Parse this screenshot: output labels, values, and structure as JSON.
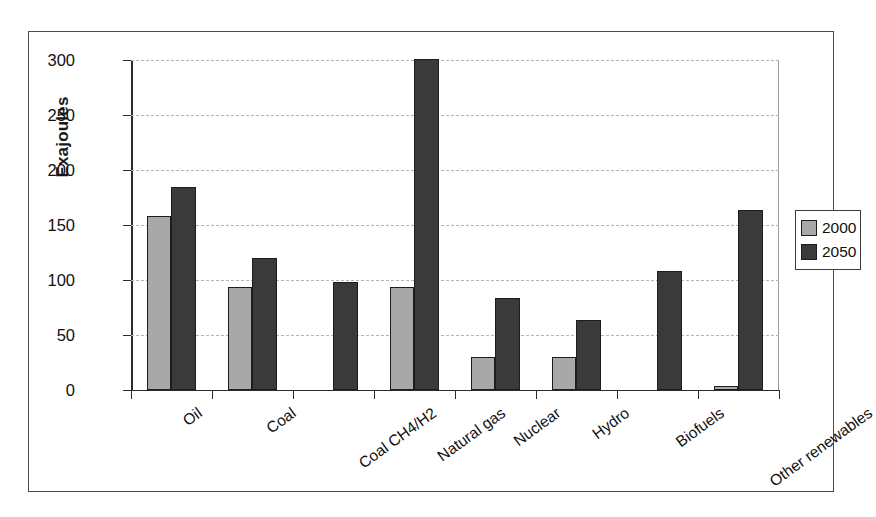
{
  "chart_data": {
    "type": "bar",
    "title": "",
    "xlabel": "",
    "ylabel": "Exajoules",
    "ylim": [
      0,
      300
    ],
    "yticks": [
      0,
      50,
      100,
      150,
      200,
      250,
      300
    ],
    "ytick_labels": [
      "0",
      "50",
      "100",
      "150",
      "200",
      "250",
      "300"
    ],
    "grid": true,
    "legend_position": "right",
    "categories": [
      "Oil",
      "Coal",
      "Coal CH4/H2",
      "Natural gas",
      "Nuclear",
      "Hydro",
      "Biofuels",
      "Other renewables"
    ],
    "series": [
      {
        "name": "2000",
        "color": "#a8a8a8",
        "values": [
          158,
          94,
          0,
          94,
          30,
          30,
          0,
          4
        ]
      },
      {
        "name": "2050",
        "color": "#3a3a3a",
        "values": [
          185,
          120,
          98,
          301,
          84,
          64,
          108,
          164
        ]
      }
    ]
  },
  "legend": {
    "entries": [
      {
        "label": "2000",
        "swatch": "light-gray"
      },
      {
        "label": "2050",
        "swatch": "dark-gray"
      }
    ]
  },
  "colors": {
    "series_2000": "#a8a8a8",
    "series_2050": "#3a3a3a",
    "axis": "#2b2b2b",
    "gridline": "#b4b4b4",
    "frame": "#4a4a4a",
    "background": "#ffffff"
  }
}
